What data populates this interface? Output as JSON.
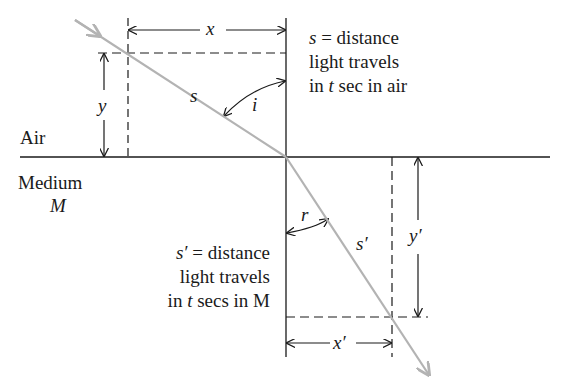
{
  "diagram": {
    "regions": {
      "upper": "Air",
      "lower_line1": "Medium",
      "lower_line2": "M"
    },
    "labels": {
      "x": "x",
      "y": "y",
      "s": "s",
      "i": "i",
      "r": "r",
      "s_prime": "s′",
      "x_prime": "x′",
      "y_prime": "y′"
    },
    "air_note": {
      "line1_var": "s",
      "line1_rest": " = distance",
      "line2": "light travels",
      "line3_pre": "in ",
      "line3_var": "t",
      "line3_post": " sec in air"
    },
    "medium_note": {
      "line1_var": "s′",
      "line1_rest": " = distance",
      "line2": "light travels",
      "line3_pre": "in ",
      "line3_var": "t",
      "line3_post": " secs in M"
    },
    "colors": {
      "ray": "#b3b3b3",
      "lines": "#1a1a1a",
      "background": "#ffffff"
    }
  }
}
